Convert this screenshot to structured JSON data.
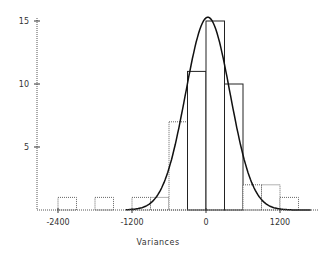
{
  "chart_data": {
    "type": "bar",
    "subtype": "histogram-with-normal-curve",
    "title": "",
    "xlabel": "Variances",
    "ylabel": "",
    "bin_width": 300,
    "bins": [
      {
        "start": -2400,
        "end": -2100,
        "count": 1
      },
      {
        "start": -2100,
        "end": -1800,
        "count": 0
      },
      {
        "start": -1800,
        "end": -1500,
        "count": 1
      },
      {
        "start": -1500,
        "end": -1200,
        "count": 0
      },
      {
        "start": -1200,
        "end": -900,
        "count": 1
      },
      {
        "start": -900,
        "end": -600,
        "count": 1
      },
      {
        "start": -600,
        "end": -300,
        "count": 7
      },
      {
        "start": -300,
        "end": 0,
        "count": 11
      },
      {
        "start": 0,
        "end": 300,
        "count": 15
      },
      {
        "start": 300,
        "end": 600,
        "count": 10
      },
      {
        "start": 600,
        "end": 900,
        "count": 2
      },
      {
        "start": 900,
        "end": 1200,
        "count": 2
      },
      {
        "start": 1200,
        "end": 1500,
        "count": 1
      }
    ],
    "x_ticks": [
      -2400,
      -1200,
      0,
      1200
    ],
    "x_tick_labels": [
      "-2400",
      "-1200",
      "0",
      "1200"
    ],
    "y_ticks": [
      5,
      10,
      15
    ],
    "y_tick_labels": [
      "5",
      "10",
      "15"
    ],
    "xlim": [
      -2700,
      1800
    ],
    "ylim": [
      0,
      15.5
    ],
    "normal_curve": {
      "mean": 30,
      "sd": 360,
      "peak": 15.3
    },
    "grid": false,
    "legend": null
  }
}
